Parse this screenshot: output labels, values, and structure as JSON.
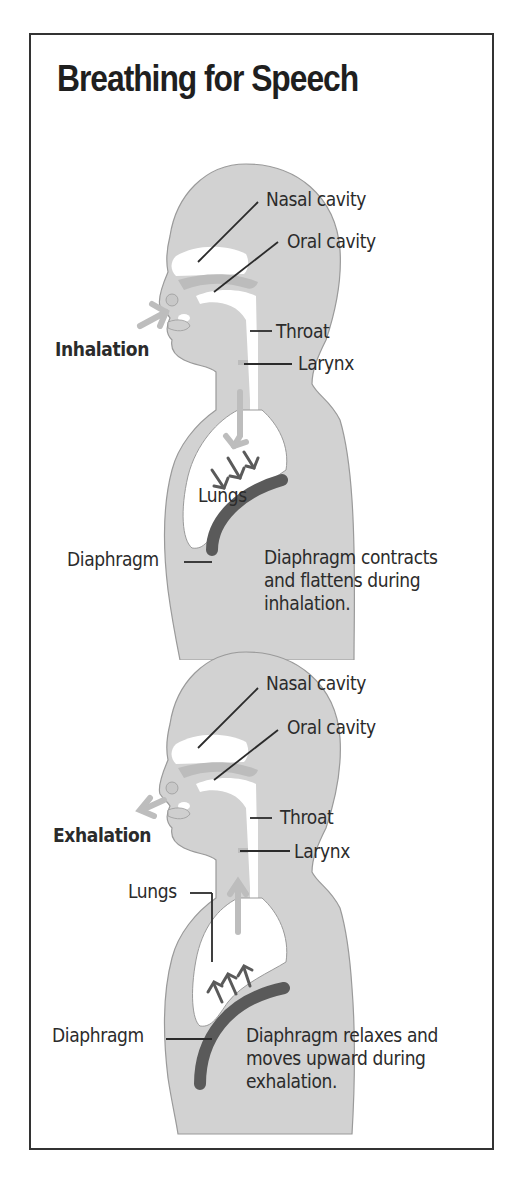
{
  "title": "Breathing for Speech",
  "colors": {
    "frame": "#333333",
    "body_fill": "#d2d2d2",
    "body_outline": "#9a9a9a",
    "diaphragm": "#5a5a5a",
    "airflow_arrow": "#bdbdbd",
    "muscle_arrow": "#5a5a5a",
    "text": "#2b2b2b"
  },
  "panels": [
    {
      "id": "inhalation",
      "phase_label": "Inhalation",
      "labels": {
        "nasal_cavity": "Nasal cavity",
        "oral_cavity": "Oral cavity",
        "throat": "Throat",
        "larynx": "Larynx",
        "lungs": "Lungs",
        "diaphragm": "Diaphragm"
      },
      "caption": "Diaphragm contracts and flattens during inhalation.",
      "airflow_direction": "in",
      "diaphragm_arrows": "down"
    },
    {
      "id": "exhalation",
      "phase_label": "Exhalation",
      "labels": {
        "nasal_cavity": "Nasal cavity",
        "oral_cavity": "Oral cavity",
        "throat": "Throat",
        "larynx": "Larynx",
        "lungs": "Lungs",
        "diaphragm": "Diaphragm"
      },
      "caption": "Diaphragm relaxes and moves upward during exhalation.",
      "airflow_direction": "out",
      "diaphragm_arrows": "up"
    }
  ]
}
